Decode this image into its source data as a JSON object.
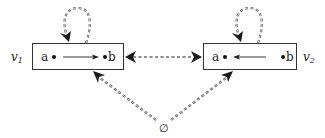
{
  "diagram": {
    "type": "graph",
    "nodes": [
      {
        "id": "v1",
        "label": "v",
        "subscript": "1",
        "inner_points": [
          {
            "name": "a"
          },
          {
            "name": "b"
          }
        ],
        "inner_edge": {
          "from": "a",
          "to": "b",
          "style": "solid"
        }
      },
      {
        "id": "v2",
        "label": "v",
        "subscript": "2",
        "inner_points": [
          {
            "name": "a"
          },
          {
            "name": "b"
          }
        ],
        "inner_edge": {
          "from": "b",
          "to": "a",
          "style": "solid"
        }
      },
      {
        "id": "empty",
        "label": "∅"
      }
    ],
    "edges": [
      {
        "from": "v1",
        "to": "v1",
        "style": "double-dashed",
        "kind": "self-loop"
      },
      {
        "from": "v2",
        "to": "v2",
        "style": "double-dashed",
        "kind": "self-loop"
      },
      {
        "from": "v1",
        "to": "v2",
        "style": "double-dashed",
        "kind": "bidirectional"
      },
      {
        "from": "empty",
        "to": "v1",
        "style": "double-dashed"
      },
      {
        "from": "empty",
        "to": "v2",
        "style": "double-dashed"
      }
    ]
  },
  "labels": {
    "v1_main": "v",
    "v1_sub": "1",
    "v2_main": "v",
    "v2_sub": "2",
    "v1_a": "a",
    "v1_b": "b",
    "v2_a": "a",
    "v2_b": "b",
    "empty": "∅"
  },
  "colors": {
    "stroke": "#333333",
    "dashed": "#555555",
    "background": "#ffffff"
  }
}
